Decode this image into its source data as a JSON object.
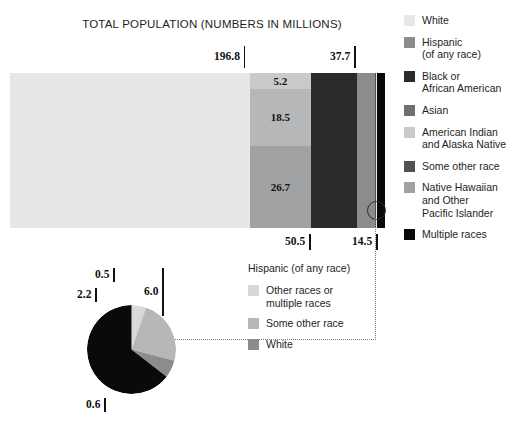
{
  "title": "TOTAL POPULATION (NUMBERS IN MILLIONS)",
  "colors": {
    "white": "#e6e7e8",
    "hispanic": "#8a8c8e",
    "black_african_american": "#2b2b2b",
    "asian": "#6e7073",
    "american_indian": "#c9cacb",
    "some_other_race": "#4f5052",
    "native_hawaiian": "#9fa1a3",
    "multiple_races": "#0a0a0a",
    "pie_other_or_multiple": "#d7d8d9",
    "pie_some_other_race": "#b6b7b9",
    "pie_white": "#8a8c8e",
    "background": "#ffffff",
    "text": "#1e1e1e"
  },
  "bar_ticks_top": [
    {
      "value": "196.8",
      "left": 214,
      "top": 46
    },
    {
      "value": "37.7",
      "left": 330,
      "top": 46
    }
  ],
  "bar_ticks_bottom": [
    {
      "value": "50.5",
      "left": 285,
      "top": 234
    },
    {
      "value": "14.5",
      "left": 352,
      "top": 234
    }
  ],
  "bar_segment_labels": [
    {
      "value": "5.2"
    },
    {
      "value": "18.5"
    },
    {
      "value": "26.7"
    }
  ],
  "pie_ticks": [
    {
      "value": "0.5",
      "left": 95,
      "top": 268,
      "type": "pie"
    },
    {
      "value": "6.0",
      "left": 144,
      "top": 268,
      "type": "pie-long"
    },
    {
      "value": "2.2",
      "left": 77,
      "top": 288,
      "type": "pie"
    },
    {
      "value": "0.6",
      "left": 86,
      "top": 398,
      "type": "pie"
    }
  ],
  "legend_main": {
    "items": [
      {
        "label": "White",
        "swatch": "#e6e7e8",
        "icon": "legend-swatch-white"
      },
      {
        "label": "Hispanic\n(of any race)",
        "swatch": "#8a8c8e",
        "icon": "legend-swatch-hispanic"
      },
      {
        "label": "Black or\nAfrican American",
        "swatch": "#2b2b2b",
        "icon": "legend-swatch-black-african-american"
      },
      {
        "label": "Asian",
        "swatch": "#6e7073",
        "icon": "legend-swatch-asian"
      },
      {
        "label": "American Indian\nand Alaska Native",
        "swatch": "#c9cacb",
        "icon": "legend-swatch-american-indian"
      },
      {
        "label": "Some other race",
        "swatch": "#4f5052",
        "icon": "legend-swatch-some-other-race"
      },
      {
        "label": "Native Hawaiian\nand Other\nPacific Islander",
        "swatch": "#9fa1a3",
        "icon": "legend-swatch-native-hawaiian"
      },
      {
        "label": "Multiple races",
        "swatch": "#0a0a0a",
        "icon": "legend-swatch-multiple-races"
      }
    ]
  },
  "legend_pie": {
    "title": "Hispanic (of any race)",
    "items": [
      {
        "label": "Other races or\nmultiple races",
        "swatch": "#d7d8d9",
        "icon": "pie-legend-swatch-other-or-multiple"
      },
      {
        "label": "Some other race",
        "swatch": "#b6b7b9",
        "icon": "pie-legend-swatch-some-other-race"
      },
      {
        "label": "White",
        "swatch": "#8a8c8e",
        "icon": "pie-legend-swatch-white"
      }
    ]
  },
  "chart_data": [
    {
      "type": "bar",
      "title": "TOTAL POPULATION (NUMBERS IN MILLIONS)",
      "orientation": "horizontal-stacked",
      "unit": "millions",
      "xlabel": "",
      "ylabel": "",
      "grid": false,
      "legend_position": "right",
      "categories": [
        "Total population"
      ],
      "series": [
        {
          "name": "White",
          "values": [
            196.8
          ],
          "color": "#e6e7e8",
          "label_shown": "196.8"
        },
        {
          "name": "Hispanic (of any race)",
          "values": [
            50.5
          ],
          "color": "#8a8c8e",
          "label_shown": "50.5",
          "substack": [
            {
              "name": "Asian",
              "value": 5.2,
              "color": "#c9cacb",
              "label_shown": "5.2"
            },
            {
              "name": "American Indian and Alaska Native",
              "value": 18.5,
              "color": "#b6b7b9",
              "label_shown": "18.5"
            },
            {
              "name": "Some other race",
              "value": 26.7,
              "color": "#a0a2a4",
              "label_shown": "26.7"
            }
          ]
        },
        {
          "name": "Black or African American",
          "values": [
            37.7
          ],
          "color": "#2b2b2b",
          "label_shown": "37.7"
        },
        {
          "name": "Asian",
          "values": [
            14.5
          ],
          "color": "#8a8c8e",
          "label_shown": "14.5"
        },
        {
          "name": "Some other race",
          "values": [
            1.0
          ],
          "color": "#4f5052",
          "label_shown": ""
        },
        {
          "name": "Native Hawaiian and Other Pacific Islander",
          "values": [
            0.6
          ],
          "color": "#e6e7e8",
          "label_shown": ""
        },
        {
          "name": "Multiple races",
          "values": [
            6.8
          ],
          "color": "#0a0a0a",
          "label_shown": ""
        }
      ],
      "annotations": [
        "196.8",
        "37.7",
        "50.5",
        "14.5"
      ]
    },
    {
      "type": "pie",
      "title": "Hispanic (of any race)",
      "unit": "millions",
      "legend_position": "right",
      "labels": [
        "Other races or multiple races",
        "Some other race",
        "White",
        "Multiple races"
      ],
      "values": [
        0.5,
        2.2,
        0.6,
        6.0
      ],
      "colors": [
        "#d7d8d9",
        "#b6b7b9",
        "#8a8c8e",
        "#0a0a0a"
      ],
      "annotations": [
        "0.5",
        "6.0",
        "2.2",
        "0.6"
      ]
    }
  ]
}
